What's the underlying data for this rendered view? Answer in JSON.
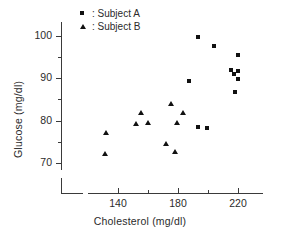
{
  "chart_data": {
    "type": "scatter",
    "title": "",
    "xlabel": "Cholesterol (mg/dl)",
    "ylabel": "Glucose (mg/dl)",
    "xlim": [
      125,
      235
    ],
    "ylim": [
      67,
      103
    ],
    "xticks": [
      140,
      160,
      180,
      200,
      220
    ],
    "xticklabels": [
      "140",
      "",
      "180",
      "",
      "220"
    ],
    "yticks": [
      70,
      75,
      80,
      85,
      90,
      95,
      100
    ],
    "yticklabels": [
      "70",
      "",
      "80",
      "",
      "90",
      "",
      "100"
    ],
    "grid": false,
    "legend_position": "top-left",
    "series": [
      {
        "name": "Subject A",
        "marker": "square",
        "color": "#111111",
        "points": [
          {
            "x": 193,
            "y": 99.8
          },
          {
            "x": 204,
            "y": 97.7
          },
          {
            "x": 220,
            "y": 95.4
          },
          {
            "x": 215,
            "y": 92.0
          },
          {
            "x": 220,
            "y": 91.8
          },
          {
            "x": 217,
            "y": 91.0
          },
          {
            "x": 220,
            "y": 89.8
          },
          {
            "x": 187,
            "y": 89.3
          },
          {
            "x": 218,
            "y": 86.8
          },
          {
            "x": 193,
            "y": 78.5
          },
          {
            "x": 199,
            "y": 78.3
          }
        ]
      },
      {
        "name": "Subject B",
        "marker": "triangle",
        "color": "#111111",
        "points": [
          {
            "x": 155,
            "y": 81.9
          },
          {
            "x": 175,
            "y": 84.0
          },
          {
            "x": 183,
            "y": 81.8
          },
          {
            "x": 152,
            "y": 79.3
          },
          {
            "x": 160,
            "y": 79.5
          },
          {
            "x": 179,
            "y": 79.5
          },
          {
            "x": 132,
            "y": 77.0
          },
          {
            "x": 172,
            "y": 74.5
          },
          {
            "x": 178,
            "y": 72.7
          },
          {
            "x": 131,
            "y": 72.2
          }
        ]
      }
    ]
  },
  "legend": {
    "items": [
      {
        "marker": "square",
        "separator": ":",
        "label": "Subject A"
      },
      {
        "marker": "triangle",
        "separator": ":",
        "label": "Subject B"
      }
    ]
  }
}
